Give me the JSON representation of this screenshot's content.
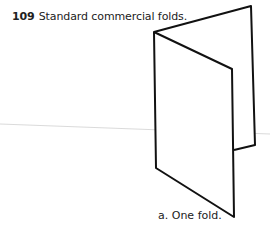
{
  "figure": {
    "number": "109",
    "title": "Standard commercial folds.",
    "subcaption": "a. One fold.",
    "colors": {
      "stroke": "#111111",
      "scan_line": "#d0d0d0",
      "background": "#ffffff"
    }
  }
}
